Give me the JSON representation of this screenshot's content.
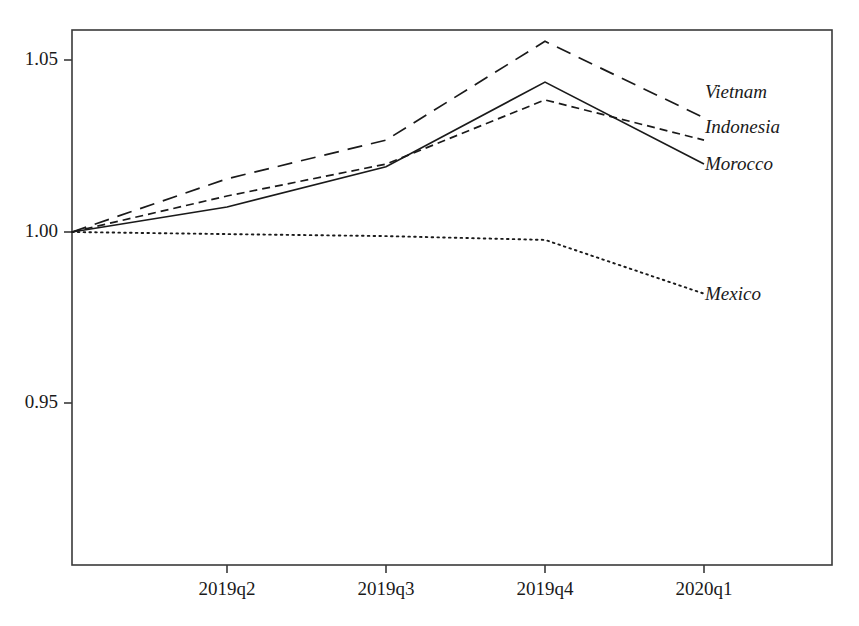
{
  "chart_data": {
    "type": "line",
    "title": "",
    "xlabel": "",
    "ylabel": "",
    "categories": [
      "2019q1",
      "2019q2",
      "2019q3",
      "2019q4",
      "2020q1"
    ],
    "x_tick_labels": [
      "2019q2",
      "2019q3",
      "2019q4",
      "2020q1"
    ],
    "y_tick_labels": [
      "1.05",
      "1.00",
      "0.95"
    ],
    "y_tick_values": [
      1.05,
      1.0,
      0.95
    ],
    "ylim": [
      0.9135,
      1.0595
    ],
    "xlim_categories": [
      "2019q1",
      "2020q1+"
    ],
    "grid": false,
    "legend": "inline-right-labels",
    "series": [
      {
        "name": "Vietnam",
        "dash": "long-dash",
        "values": [
          1.0,
          1.0155,
          1.0268,
          1.0556,
          1.0333
        ]
      },
      {
        "name": "Indonesia",
        "dash": "short-dash",
        "values": [
          1.0,
          1.0105,
          1.0198,
          1.0385,
          1.0268
        ]
      },
      {
        "name": "Morocco",
        "dash": "solid",
        "values": [
          1.0,
          1.0073,
          1.019,
          1.0437,
          1.0198
        ]
      },
      {
        "name": "Mexico",
        "dash": "dotted",
        "values": [
          1.0,
          0.9994,
          0.9988,
          0.9977,
          0.982
        ]
      }
    ]
  },
  "labels": {
    "vietnam": "Vietnam",
    "indonesia": "Indonesia",
    "morocco": "Morocco",
    "mexico": "Mexico"
  },
  "y_axis": {
    "t0": "1.05",
    "t1": "1.00",
    "t2": "0.95"
  },
  "x_axis": {
    "t0": "2019q2",
    "t1": "2019q3",
    "t2": "2019q4",
    "t3": "2020q1"
  },
  "colors": {
    "line": "#1a1a1a",
    "axis": "#3a3a3a",
    "background": "#ffffff"
  }
}
